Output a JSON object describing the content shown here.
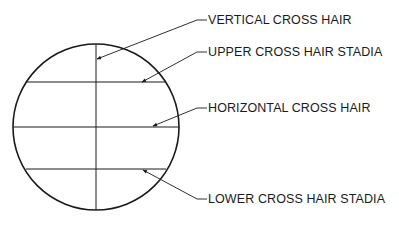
{
  "diagram": {
    "colors": {
      "stroke": "#1a1a1a",
      "background": "#ffffff"
    },
    "labels": [
      {
        "id": "vertical",
        "text": "VERTICAL CROSS HAIR"
      },
      {
        "id": "upper",
        "text": "UPPER CROSS HAIR STADIA"
      },
      {
        "id": "horizontal",
        "text": "HORIZONTAL CROSS HAIR"
      },
      {
        "id": "lower",
        "text": "LOWER CROSS HAIR STADIA"
      }
    ]
  }
}
